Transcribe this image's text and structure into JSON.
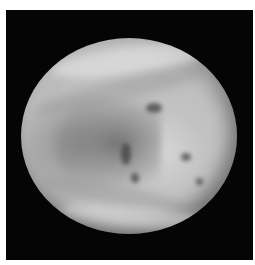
{
  "image": {
    "subject": "planet",
    "description": "Grayscale ultraviolet-style image of a cloud-covered planet (Venus) on a black background",
    "colors": {
      "background_margin": "#ffffff",
      "space": "#050505",
      "cloud_light": "#d8d8d8",
      "cloud_mid": "#bdbdbd",
      "cloud_dark": "#5a5a5a"
    }
  }
}
